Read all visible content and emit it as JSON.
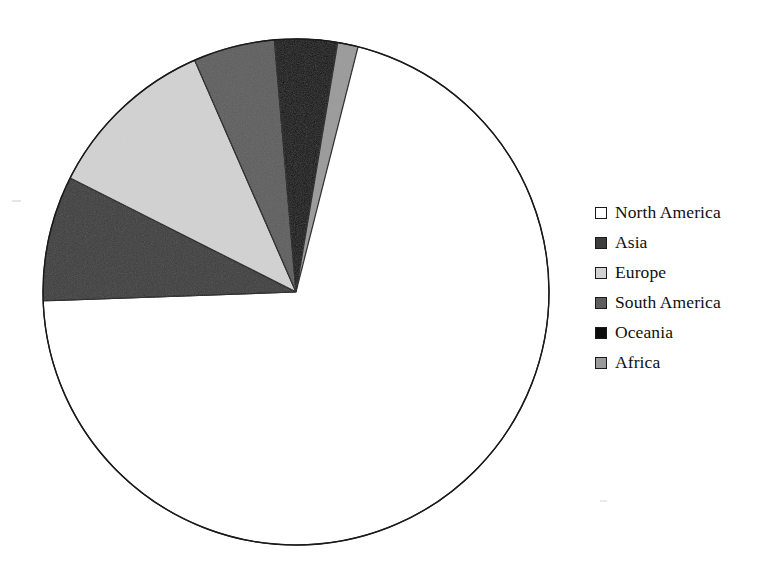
{
  "chart_data": {
    "type": "pie",
    "title": "",
    "subtitle": "",
    "xlabel": "",
    "ylabel": "",
    "grid": false,
    "legend_position": "right",
    "start_angle_deg": 90,
    "direction": "counterclockwise",
    "categories": [
      "North America",
      "Asia",
      "Europe",
      "South America",
      "Oceania",
      "Africa"
    ],
    "values": [
      74.0,
      8.0,
      11.0,
      5.2,
      4.0,
      1.3
    ],
    "unit": "percent",
    "slices": [
      {
        "label": "North America",
        "value": 74.0,
        "color": "#ffffff",
        "start_deg": 90.0,
        "end_deg": -178.0
      },
      {
        "label": "Asia",
        "value": 8.0,
        "color": "#3d3d3d",
        "start_deg": 182.0,
        "end_deg": 153.2
      },
      {
        "label": "Europe",
        "value": 11.0,
        "color": "#d2d2d2",
        "start_deg": 153.2,
        "end_deg": 113.6
      },
      {
        "label": "South America",
        "value": 5.2,
        "color": "#5e5e5e",
        "start_deg": 113.6,
        "end_deg": 94.9
      },
      {
        "label": "Oceania",
        "value": 4.0,
        "color": "#0d0d0d",
        "start_deg": 94.9,
        "end_deg": 80.5
      },
      {
        "label": "Africa",
        "value": 1.3,
        "color": "#9a9a9a",
        "start_deg": 80.5,
        "end_deg": 75.8
      }
    ],
    "outline_color": "#1a1a1a",
    "center": {
      "x": 296,
      "y": 292
    },
    "radius": 253
  },
  "legend": {
    "items": [
      {
        "label": "North America",
        "color": "#ffffff"
      },
      {
        "label": "Asia",
        "color": "#3d3d3d"
      },
      {
        "label": "Europe",
        "color": "#d2d2d2"
      },
      {
        "label": "South America",
        "color": "#5e5e5e"
      },
      {
        "label": "Oceania",
        "color": "#0d0d0d"
      },
      {
        "label": "Africa",
        "color": "#9a9a9a"
      }
    ]
  }
}
